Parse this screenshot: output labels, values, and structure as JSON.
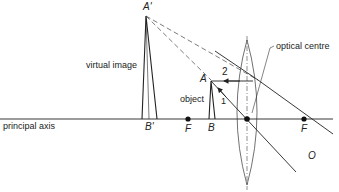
{
  "diagram": {
    "type": "ray-diagram",
    "colors": {
      "ink": "#222222",
      "background": "#ffffff",
      "construction": "#555555"
    },
    "labels": {
      "image_top": "A'",
      "image_base": "B'",
      "object_top": "A",
      "object_base": "B",
      "focus_left": "F",
      "focus_right": "F",
      "lens_centre": "O",
      "ray_1": "1",
      "ray_2": "2",
      "virtual_image": "virtual image",
      "object": "object",
      "optical_centre": "optical centre",
      "principal_axis": "principal axis"
    },
    "geometry": {
      "principal_axis_y": 119,
      "lens_x": 247,
      "lens_top_y": 40,
      "lens_bottom_y": 185,
      "focus_left_x": 188,
      "focus_right_x": 304,
      "object_x": 211,
      "object_top_y": 80,
      "image_x": 146,
      "image_top_y": 14
    }
  }
}
